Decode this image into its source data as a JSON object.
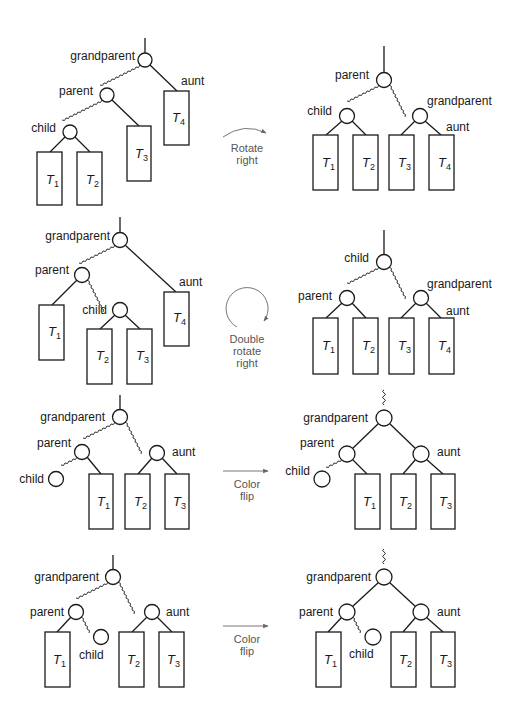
{
  "colors": {
    "ink": "#1a1a1a",
    "arrow": "#666666",
    "background": "#ffffff"
  },
  "labels": {
    "grandparent": "grandparent",
    "parent": "parent",
    "child": "child",
    "aunt": "aunt"
  },
  "subtrees": {
    "t1": {
      "base": "T",
      "sub": "1"
    },
    "t2": {
      "base": "T",
      "sub": "2"
    },
    "t3": {
      "base": "T",
      "sub": "3"
    },
    "t4": {
      "base": "T",
      "sub": "4"
    }
  },
  "transformations": [
    {
      "id": "rotate-right",
      "lines": [
        "Rotate",
        "right"
      ],
      "arrow": "curved-arc"
    },
    {
      "id": "double-rotate-right",
      "lines": [
        "Double",
        "rotate",
        "right"
      ],
      "arrow": "circular"
    },
    {
      "id": "color-flip-1",
      "lines": [
        "Color",
        "flip"
      ],
      "arrow": "straight"
    },
    {
      "id": "color-flip-2",
      "lines": [
        "Color",
        "flip"
      ],
      "arrow": "straight"
    }
  ]
}
